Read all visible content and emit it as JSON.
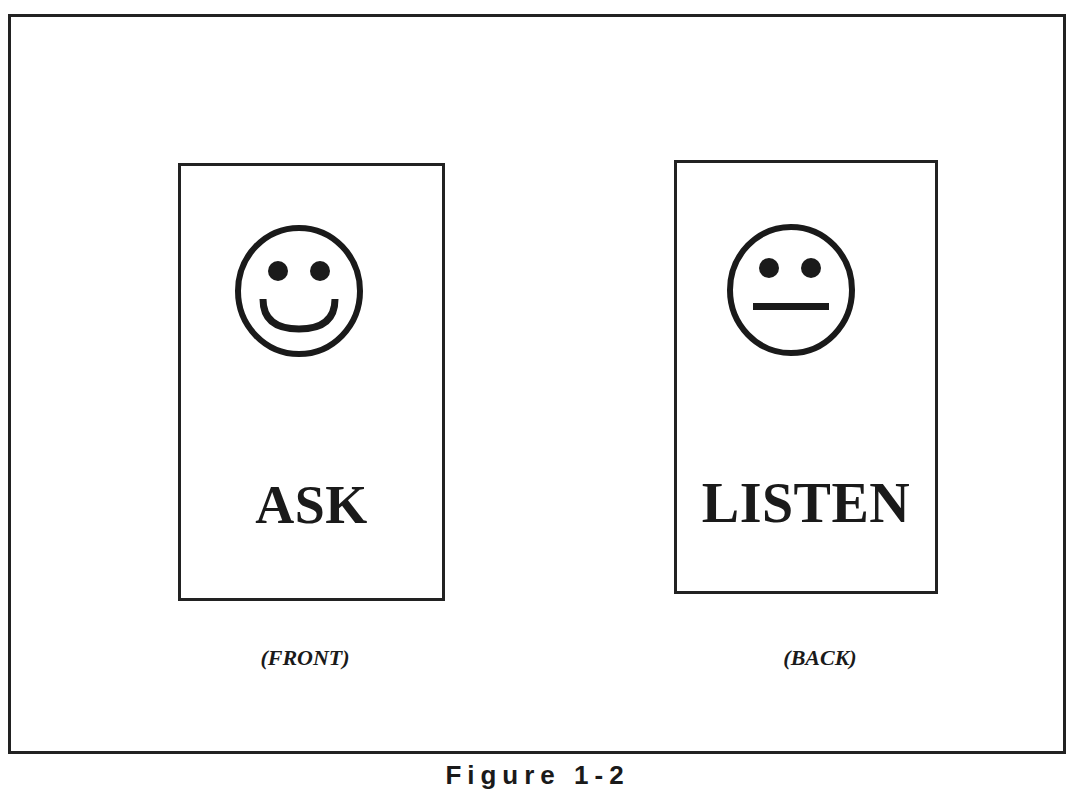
{
  "figure": {
    "caption": "Figure 1-2",
    "front_card": {
      "icon": "smiley-face-icon",
      "word": "ASK",
      "side_label": "(FRONT)"
    },
    "back_card": {
      "icon": "neutral-face-icon",
      "word": "LISTEN",
      "side_label": "(BACK)"
    },
    "colors": {
      "ink": "#1a1a1a",
      "background": "#ffffff"
    }
  }
}
